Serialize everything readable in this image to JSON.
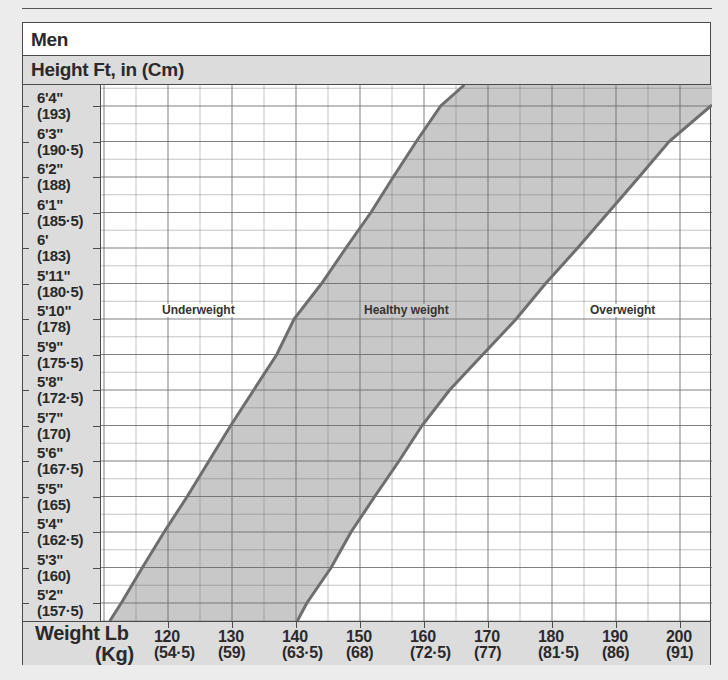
{
  "title": "Men",
  "subtitle": "Height Ft, in (Cm)",
  "x_axis": {
    "title_lb": "Weight Lb",
    "title_kg": "(Kg)",
    "ticks": [
      {
        "lb": "120",
        "kg": "(54·5)"
      },
      {
        "lb": "130",
        "kg": "(59)"
      },
      {
        "lb": "140",
        "kg": "(63·5)"
      },
      {
        "lb": "150",
        "kg": "(68)"
      },
      {
        "lb": "160",
        "kg": "(72·5)"
      },
      {
        "lb": "170",
        "kg": "(77)"
      },
      {
        "lb": "180",
        "kg": "(81·5)"
      },
      {
        "lb": "190",
        "kg": "(86)"
      },
      {
        "lb": "200",
        "kg": "(91)"
      }
    ]
  },
  "y_axis": {
    "ticks": [
      {
        "ft": "6'4\"",
        "cm": "(193)"
      },
      {
        "ft": "6'3\"",
        "cm": "(190·5)"
      },
      {
        "ft": "6'2\"",
        "cm": "(188)"
      },
      {
        "ft": "6'1\"",
        "cm": "(185·5)"
      },
      {
        "ft": "6'",
        "cm": "(183)"
      },
      {
        "ft": "5'11\"",
        "cm": "(180·5)"
      },
      {
        "ft": "5'10\"",
        "cm": "(178)"
      },
      {
        "ft": "5'9\"",
        "cm": "(175·5)"
      },
      {
        "ft": "5'8\"",
        "cm": "(172·5)"
      },
      {
        "ft": "5'7\"",
        "cm": "(170)"
      },
      {
        "ft": "5'6\"",
        "cm": "(167·5)"
      },
      {
        "ft": "5'5\"",
        "cm": "(165)"
      },
      {
        "ft": "5'4\"",
        "cm": "(162·5)"
      },
      {
        "ft": "5'3\"",
        "cm": "(160)"
      },
      {
        "ft": "5'2\"",
        "cm": "(157·5)"
      }
    ]
  },
  "regions": {
    "underweight": "Underweight",
    "healthy": "Healthy weight",
    "overweight": "Overweight"
  },
  "colors": {
    "band_fill": "#c8c8c8",
    "boundary_line": "#6e6e6e",
    "grid": "#6a6a6a",
    "panel": "#dcdcdc"
  },
  "chart_data": {
    "type": "area",
    "title": "Men",
    "xlabel": "Weight Lb (Kg)",
    "ylabel": "Height Ft, in (Cm)",
    "xlim_lb": [
      107,
      206
    ],
    "ylim_in": [
      61.5,
      76.6
    ],
    "grid": true,
    "x_ticks_lb": [
      120,
      130,
      140,
      150,
      160,
      170,
      180,
      190,
      200
    ],
    "x_ticks_kg": [
      54.5,
      59,
      63.5,
      68,
      72.5,
      77,
      81.5,
      86,
      91
    ],
    "y_ticks_in": [
      76,
      75,
      74,
      73,
      72,
      71,
      70,
      69,
      68,
      67,
      66,
      65,
      64,
      63,
      62
    ],
    "y_ticks_cm": [
      193,
      190.5,
      188,
      185.5,
      183,
      180.5,
      178,
      175.5,
      172.5,
      170,
      167.5,
      165,
      162.5,
      160,
      157.5
    ],
    "regions": [
      "Underweight",
      "Healthy weight",
      "Overweight"
    ],
    "series": [
      {
        "name": "Underweight / Healthy boundary",
        "height_in": [
          62,
          63,
          64,
          65,
          66,
          67,
          68,
          69,
          70,
          71,
          72,
          73,
          74,
          75,
          76
        ],
        "weight_lb": [
          112.7,
          116,
          119.4,
          123,
          126.4,
          129.8,
          133.4,
          137,
          139.7,
          144,
          147.8,
          151.7,
          155.2,
          158.8,
          162.6
        ]
      },
      {
        "name": "Healthy / Overweight boundary",
        "height_in": [
          62,
          63,
          64,
          65,
          66,
          67,
          68,
          69,
          70,
          71,
          72,
          73,
          74,
          75,
          76
        ],
        "weight_lb": [
          141.7,
          145.5,
          148.6,
          152.3,
          156.1,
          159.7,
          164,
          169.2,
          174.4,
          179,
          184,
          188.8,
          193.6,
          198.3,
          204.8
        ]
      }
    ]
  }
}
